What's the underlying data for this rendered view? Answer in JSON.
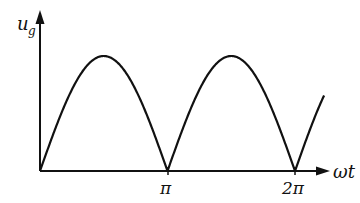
{
  "chart_data": {
    "type": "line",
    "title": "",
    "xlabel": "ωt",
    "ylabel_main": "u",
    "ylabel_sub": "g",
    "x_ticks": [
      {
        "value": 3.14159,
        "label": "π"
      },
      {
        "value": 6.28318,
        "label": "2π"
      }
    ],
    "function": "|sin(ωt)|",
    "x_range": [
      0,
      7.0
    ],
    "y_range": [
      0,
      1
    ],
    "grid": false,
    "legend": null,
    "samples": {
      "x": [
        0,
        0.785,
        1.571,
        2.356,
        3.142,
        3.927,
        4.712,
        5.498,
        6.283,
        6.9
      ],
      "y": [
        0,
        0.707,
        1.0,
        0.707,
        0,
        0.707,
        1.0,
        0.707,
        0,
        0.58
      ]
    }
  },
  "axes": {
    "x_label": "ωt",
    "y_label_main": "u",
    "y_label_sub": "g",
    "tick_pi": "π",
    "tick_2pi": "2π"
  },
  "colors": {
    "stroke": "#111111",
    "background": "#ffffff"
  }
}
